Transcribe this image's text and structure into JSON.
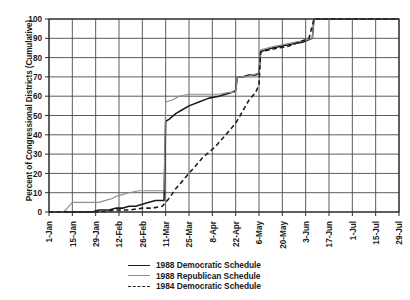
{
  "chart_data": {
    "type": "line",
    "title": "",
    "xlabel": "",
    "ylabel": "Percent of Congressional Districts (Cumulative)",
    "ylim": [
      0,
      100
    ],
    "ytick_step": 10,
    "yticks": [
      0,
      10,
      20,
      30,
      40,
      50,
      60,
      70,
      80,
      90,
      100
    ],
    "xticks": [
      "1-Jan",
      "15-Jan",
      "29-Jan",
      "12-Feb",
      "26-Feb",
      "11-Mar",
      "25-Mar",
      "8-Apr",
      "22-Apr",
      "6-May",
      "20-May",
      "3-Jun",
      "17-Jun",
      "1-Jul",
      "15-Jul",
      "29-Jul"
    ],
    "grid": true,
    "legend_position": "bottom-center",
    "series": [
      {
        "name": "1988 Democratic Schedule",
        "color": "#1b1b1b",
        "style": "solid",
        "points": [
          [
            0,
            0
          ],
          [
            10,
            0
          ],
          [
            26,
            0
          ],
          [
            30,
            1
          ],
          [
            36,
            1
          ],
          [
            40,
            2
          ],
          [
            44,
            2
          ],
          [
            48,
            3
          ],
          [
            52,
            3
          ],
          [
            56,
            4
          ],
          [
            60,
            5
          ],
          [
            64,
            6
          ],
          [
            68,
            6
          ],
          [
            69,
            6
          ],
          [
            70,
            47
          ],
          [
            72,
            48
          ],
          [
            76,
            51
          ],
          [
            80,
            53
          ],
          [
            84,
            55
          ],
          [
            90,
            57
          ],
          [
            96,
            59
          ],
          [
            102,
            60
          ],
          [
            110,
            62
          ],
          [
            112,
            63
          ],
          [
            113,
            70
          ],
          [
            116,
            70
          ],
          [
            120,
            71
          ],
          [
            124,
            71
          ],
          [
            126,
            72
          ],
          [
            127,
            83
          ],
          [
            130,
            84
          ],
          [
            134,
            85
          ],
          [
            140,
            86
          ],
          [
            146,
            87
          ],
          [
            152,
            88
          ],
          [
            158,
            90
          ],
          [
            159,
            100
          ],
          [
            168,
            100
          ],
          [
            180,
            100
          ],
          [
            200,
            100
          ],
          [
            210,
            100
          ]
        ]
      },
      {
        "name": "1988 Republican Schedule",
        "color": "#8e8e8e",
        "style": "solid",
        "points": [
          [
            0,
            0
          ],
          [
            8,
            0
          ],
          [
            10,
            1
          ],
          [
            12,
            3
          ],
          [
            14,
            5
          ],
          [
            18,
            5
          ],
          [
            24,
            5
          ],
          [
            30,
            5
          ],
          [
            34,
            6
          ],
          [
            38,
            7
          ],
          [
            40,
            8
          ],
          [
            44,
            9
          ],
          [
            48,
            10
          ],
          [
            54,
            11
          ],
          [
            58,
            11
          ],
          [
            64,
            11
          ],
          [
            68,
            11
          ],
          [
            69,
            11
          ],
          [
            70,
            57
          ],
          [
            74,
            58
          ],
          [
            78,
            60
          ],
          [
            84,
            61
          ],
          [
            90,
            61
          ],
          [
            96,
            61
          ],
          [
            102,
            61
          ],
          [
            108,
            62
          ],
          [
            112,
            62
          ],
          [
            113,
            70
          ],
          [
            118,
            70
          ],
          [
            122,
            71
          ],
          [
            126,
            72
          ],
          [
            127,
            84
          ],
          [
            131,
            85
          ],
          [
            136,
            86
          ],
          [
            142,
            87
          ],
          [
            148,
            88
          ],
          [
            154,
            89
          ],
          [
            158,
            90
          ],
          [
            159,
            100
          ],
          [
            170,
            100
          ],
          [
            190,
            100
          ],
          [
            210,
            100
          ]
        ]
      },
      {
        "name": "1984 Democratic Schedule",
        "color": "#1b1b1b",
        "style": "dashed",
        "points": [
          [
            0,
            0
          ],
          [
            20,
            0
          ],
          [
            30,
            0
          ],
          [
            40,
            1
          ],
          [
            48,
            1
          ],
          [
            56,
            2
          ],
          [
            62,
            2
          ],
          [
            68,
            3
          ],
          [
            72,
            7
          ],
          [
            76,
            12
          ],
          [
            80,
            16
          ],
          [
            84,
            20
          ],
          [
            88,
            24
          ],
          [
            92,
            28
          ],
          [
            96,
            31
          ],
          [
            100,
            34
          ],
          [
            104,
            38
          ],
          [
            108,
            42
          ],
          [
            112,
            46
          ],
          [
            116,
            52
          ],
          [
            120,
            58
          ],
          [
            124,
            62
          ],
          [
            126,
            66
          ],
          [
            127,
            83
          ],
          [
            132,
            84
          ],
          [
            138,
            85
          ],
          [
            144,
            86
          ],
          [
            150,
            88
          ],
          [
            156,
            90
          ],
          [
            159,
            100
          ],
          [
            175,
            100
          ],
          [
            195,
            100
          ],
          [
            210,
            100
          ]
        ]
      }
    ]
  },
  "legend": {
    "items": [
      {
        "label": "1988 Democratic Schedule"
      },
      {
        "label": "1988 Republican Schedule"
      },
      {
        "label": "1984 Democratic Schedule"
      }
    ]
  },
  "axis": {
    "y_title": "Percent of Congressional Districts (Cumulative)"
  },
  "colors": {
    "dem88": "#1b1b1b",
    "rep88": "#8e8e8e",
    "dem84": "#1b1b1b",
    "grid": "#4a4a4a",
    "axis": "#2b2b2b"
  }
}
